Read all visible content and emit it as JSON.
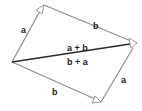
{
  "diagram": {
    "colors": {
      "edge": "#8c8c8c",
      "resultant": "#2a2a2a",
      "arrowhead_fill": "#ffffff",
      "text": "#1a1a1a"
    },
    "vectors": [
      {
        "id": "a-top",
        "label": "a"
      },
      {
        "id": "b-top",
        "label": "b"
      },
      {
        "id": "b-bottom",
        "label": "b"
      },
      {
        "id": "a-right",
        "label": "a"
      },
      {
        "id": "resultant",
        "label_above": "a + b",
        "label_below": "b + a"
      }
    ]
  }
}
